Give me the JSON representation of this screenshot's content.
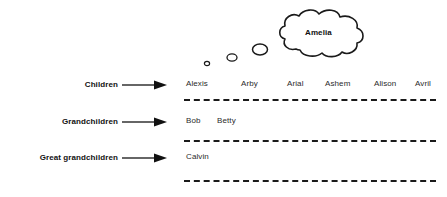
{
  "diagram": {
    "title_in_cloud": "Amelia",
    "generations": [
      {
        "label": "Children",
        "arrow_icon": "right-arrow-icon",
        "members": [
          "Alexis",
          "Arby",
          "Arial",
          "Ashem",
          "Alison",
          "Avril"
        ]
      },
      {
        "label": "Grandchildren",
        "arrow_icon": "right-arrow-icon",
        "members": [
          "Bob",
          "Betty"
        ]
      },
      {
        "label": "Great grandchildren",
        "arrow_icon": "right-arrow-icon",
        "members": [
          "Calvin"
        ]
      }
    ],
    "thought_trail": {
      "icon": "thought-bubble-trail-icon",
      "bubble_count": 3
    },
    "colors": {
      "ink": "#1a1a1a",
      "text": "#2b2b2b",
      "background": "#ffffff"
    }
  }
}
